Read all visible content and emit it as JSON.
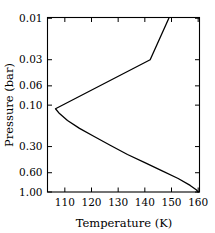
{
  "chart_data": {
    "type": "line",
    "title": "",
    "xlabel": "Temperature (K)",
    "ylabel": "Pressure (bar)",
    "xlim": [
      103.5,
      160.5
    ],
    "ylim": [
      1.0,
      0.0098
    ],
    "yscale": "log",
    "y_inverted": true,
    "grid": false,
    "legend": null,
    "xticks": [
      110,
      120,
      130,
      140,
      150,
      160
    ],
    "xticklabels": [
      "110",
      "120",
      "130",
      "140",
      "150",
      "160"
    ],
    "yticks": [
      0.01,
      0.03,
      0.06,
      0.1,
      0.3,
      0.6,
      1.0
    ],
    "yticklabels": [
      "0.01",
      "0.03",
      "0.06",
      "0.10",
      "0.30",
      "0.60",
      "1.00"
    ],
    "series": [
      {
        "name": "temperature-pressure-profile",
        "color": "#000000",
        "x": [
          149.0,
          142.0,
          106.5,
          108.0,
          111.0,
          115.5,
          121.0,
          127.0,
          133.5,
          140.0,
          146.5,
          152.5,
          157.0,
          159.4,
          160.0
        ],
        "y": [
          0.01,
          0.03,
          0.11,
          0.125,
          0.15,
          0.185,
          0.23,
          0.29,
          0.37,
          0.46,
          0.57,
          0.7,
          0.84,
          0.95,
          1.0
        ]
      }
    ]
  }
}
